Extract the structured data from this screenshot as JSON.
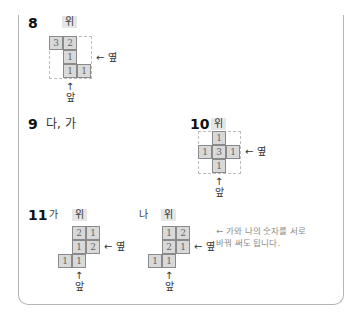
{
  "labels": {
    "top": "위",
    "side": "옆",
    "front": "앞",
    "arrow_left": "←",
    "arrow_up": "↑"
  },
  "problems": {
    "p8": {
      "number": "8",
      "cells": [
        {
          "row": 0,
          "col": 0,
          "value": "3"
        },
        {
          "row": 0,
          "col": 1,
          "value": "2"
        },
        {
          "row": 1,
          "col": 1,
          "value": "1"
        },
        {
          "row": 2,
          "col": 1,
          "value": "1"
        },
        {
          "row": 2,
          "col": 2,
          "value": "1"
        }
      ]
    },
    "p9": {
      "number": "9",
      "answer": "다, 가"
    },
    "p10": {
      "number": "10",
      "cells": [
        {
          "row": 0,
          "col": 1,
          "value": "1"
        },
        {
          "row": 1,
          "col": 0,
          "value": "1"
        },
        {
          "row": 1,
          "col": 1,
          "value": "3"
        },
        {
          "row": 1,
          "col": 2,
          "value": "1"
        },
        {
          "row": 2,
          "col": 1,
          "value": "1"
        }
      ]
    },
    "p11": {
      "number": "11",
      "ga": {
        "label": "가",
        "cells": [
          {
            "row": 0,
            "col": 1,
            "value": "2"
          },
          {
            "row": 0,
            "col": 2,
            "value": "1"
          },
          {
            "row": 1,
            "col": 1,
            "value": "1"
          },
          {
            "row": 1,
            "col": 2,
            "value": "2"
          },
          {
            "row": 2,
            "col": 0,
            "value": "1"
          },
          {
            "row": 2,
            "col": 1,
            "value": "1"
          }
        ]
      },
      "na": {
        "label": "나",
        "cells": [
          {
            "row": 0,
            "col": 1,
            "value": "1"
          },
          {
            "row": 0,
            "col": 2,
            "value": "2"
          },
          {
            "row": 1,
            "col": 1,
            "value": "2"
          },
          {
            "row": 1,
            "col": 2,
            "value": "1"
          },
          {
            "row": 2,
            "col": 0,
            "value": "1"
          },
          {
            "row": 2,
            "col": 1,
            "value": "1"
          }
        ]
      },
      "note": "← 가와 나의 숫자를 서로 바꿔 써도 됩니다."
    }
  }
}
